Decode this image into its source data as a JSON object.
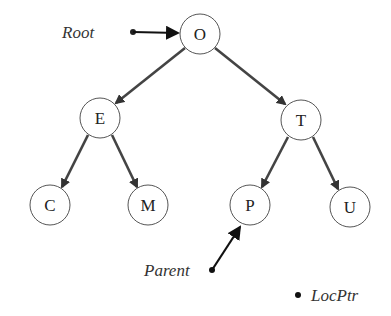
{
  "diagram": {
    "type": "binary-search-tree",
    "nodes": [
      {
        "id": "O",
        "label": "O",
        "x": 200,
        "y": 34
      },
      {
        "id": "E",
        "label": "E",
        "x": 100,
        "y": 118
      },
      {
        "id": "T",
        "label": "T",
        "x": 301,
        "y": 120
      },
      {
        "id": "C",
        "label": "C",
        "x": 50,
        "y": 205
      },
      {
        "id": "M",
        "label": "M",
        "x": 148,
        "y": 205
      },
      {
        "id": "P",
        "label": "P",
        "x": 250,
        "y": 205
      },
      {
        "id": "U",
        "label": "U",
        "x": 350,
        "y": 207
      }
    ],
    "edges": [
      {
        "from": "O",
        "to": "E"
      },
      {
        "from": "O",
        "to": "T"
      },
      {
        "from": "E",
        "to": "C"
      },
      {
        "from": "E",
        "to": "M"
      },
      {
        "from": "T",
        "to": "P"
      },
      {
        "from": "T",
        "to": "U"
      }
    ],
    "pointers": {
      "root": {
        "label": "Root",
        "points_to": "O"
      },
      "parent": {
        "label": "Parent",
        "points_to": "P"
      },
      "locptr": {
        "label": "LocPtr",
        "points_to": null
      }
    }
  }
}
